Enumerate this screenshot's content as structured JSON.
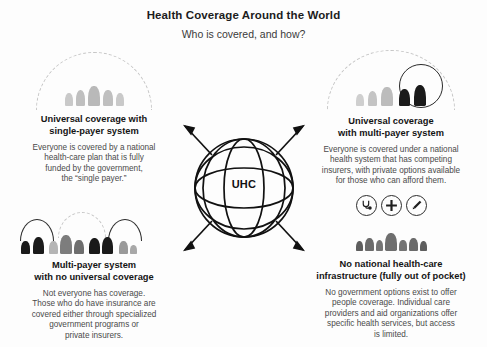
{
  "header": {
    "title": "Health Coverage Around the World",
    "subtitle": "Who is covered, and how?"
  },
  "center": {
    "label": "UHC",
    "icon": "globe-icon",
    "arrows": [
      "arrow-up-left",
      "arrow-up-right",
      "arrow-down-left",
      "arrow-down-right"
    ]
  },
  "colors": {
    "background": "#fdfdfd",
    "title_text": "#1c1c1c",
    "body_text": "#4a4a4a",
    "heading_text": "#141414",
    "figure_light_gray": "#c9c9c9",
    "figure_mid_gray": "#b9b9b9",
    "figure_dark_gray": "#6e6e6e",
    "figure_black": "#1a1a1a",
    "arc_dashed": "#c6c6c6",
    "arc_solid": "#2a2a2a",
    "globe_stroke": "#111111"
  },
  "quadrants": [
    {
      "id": "universal-single-payer",
      "heading": "Universal coverage with\nsingle-payer system",
      "heading_lines": [
        "Universal coverage with",
        "single-payer system"
      ],
      "body": "Everyone is covered by a national health-care plan that is fully funded by the government, the “single payer.”",
      "body_lines": [
        "Everyone is covered by a national",
        "health-care plan that is fully",
        "funded by the government,",
        "the “single payer.”"
      ],
      "art": {
        "type": "figures-under-dome",
        "dome_style": "dashed",
        "figure_count": 5,
        "figure_color": "figure_mid_gray",
        "covered_count": 5,
        "uncovered_count": 0
      }
    },
    {
      "id": "universal-multi-payer",
      "heading": "Universal coverage\nwith multi-payer system",
      "heading_lines": [
        "Universal coverage",
        "with multi-payer system"
      ],
      "body": "Everyone is covered under a national health system that has competing insurers, with private options available for those who can afford them.",
      "body_lines": [
        "Everyone is covered under a national",
        "health system that has competing",
        "insurers, with private options available",
        "for those who can afford them."
      ],
      "art": {
        "type": "figures-under-dome-with-inner-ring",
        "dome_style": "dashed",
        "inner_ring": true,
        "figure_count": 5,
        "gray_count": 3,
        "black_count": 2
      }
    },
    {
      "id": "multi-payer-no-universal",
      "heading": "Multi-payer system\nwith no universal coverage",
      "heading_lines": [
        "Multi-payer system",
        "with no universal coverage"
      ],
      "body": "Not everyone has coverage. Those who do have insurance are covered either through specialized government programs or private insurers.",
      "body_lines": [
        "Not everyone has coverage.",
        "Those who do have insurance are",
        "covered either through specialized",
        "government programs or",
        "private insurers."
      ],
      "art": {
        "type": "grouped-arcs",
        "groups": [
          {
            "arc": "solid",
            "figures": 2,
            "color": "figure_black"
          },
          {
            "arc": "dashed",
            "figures": 3,
            "color": "figure_dark_gray"
          },
          {
            "arc": "solid",
            "figures": 2,
            "color": "figure_black"
          },
          {
            "arc": "none",
            "figures": 2,
            "color": "figure_dark_gray"
          }
        ]
      }
    },
    {
      "id": "no-national-infrastructure",
      "heading": "No national health-care\ninfrastructure (fully out of pocket)",
      "heading_lines": [
        "No national health-care",
        "infrastructure (fully out of pocket)"
      ],
      "body": "No government options exist to offer people coverage. Individual care providers and aid organizations offer specific health services, but access is limited.",
      "body_lines": [
        "No government options exist to offer",
        "people coverage. Individual care",
        "providers and aid organizations offer",
        "specific health services, but access",
        "is limited."
      ],
      "art": {
        "type": "icons-above-figures",
        "icons": [
          "stethoscope-icon",
          "medical-cross-icon",
          "syringe-icon"
        ],
        "figure_count": 7,
        "figure_color": "figure_dark_gray",
        "dome_style": "none"
      }
    }
  ]
}
